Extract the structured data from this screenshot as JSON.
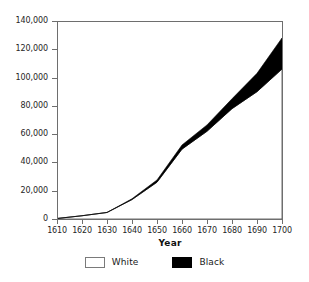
{
  "chart_data": {
    "type": "area",
    "title": "",
    "subtitle": "",
    "xlabel": "Year",
    "ylabel": "",
    "stacked": true,
    "grid": false,
    "legend_position": "bottom",
    "x": [
      1610,
      1620,
      1630,
      1640,
      1650,
      1660,
      1670,
      1680,
      1690,
      1700
    ],
    "xlim": [
      1610,
      1700
    ],
    "ylim": [
      0,
      140000
    ],
    "ytick_labels": [
      "0",
      "20,000",
      "40,000",
      "60,000",
      "80,000",
      "100,000",
      "120,000",
      "140,000"
    ],
    "ytick_values": [
      0,
      20000,
      40000,
      60000,
      80000,
      100000,
      120000,
      140000
    ],
    "xtick_labels": [
      "1610",
      "1620",
      "1630",
      "1640",
      "1650",
      "1660",
      "1670",
      "1680",
      "1690",
      "1700"
    ],
    "series": [
      {
        "name": "White",
        "color": "#ffffff",
        "edge_color": "#555555",
        "values": [
          350,
          2300,
          4600,
          13700,
          26000,
          49400,
          62000,
          78000,
          90000,
          106000
        ]
      },
      {
        "name": "Black",
        "color": "#000000",
        "edge_color": "#000000",
        "values": [
          20,
          20,
          60,
          600,
          1600,
          2900,
          4500,
          7000,
          13000,
          22000
        ]
      }
    ],
    "totals": [
      370,
      2320,
      4660,
      14300,
      27600,
      52300,
      66500,
      85000,
      103000,
      128000
    ]
  },
  "axes": {
    "x_title": "Year"
  },
  "legend": {
    "items": [
      {
        "label": "White",
        "swatch": "white-swatch",
        "color": "#ffffff"
      },
      {
        "label": "Black",
        "swatch": "black-swatch",
        "color": "#000000"
      }
    ]
  }
}
